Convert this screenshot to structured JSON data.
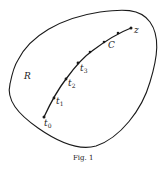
{
  "figure": {
    "caption": "Fig. 1",
    "region_label": "R",
    "curve_label": "C",
    "endpoint_label": "z",
    "points": [
      {
        "base": "t",
        "sub": "0"
      },
      {
        "base": "t",
        "sub": "1"
      },
      {
        "base": "t",
        "sub": "2"
      },
      {
        "base": "t",
        "sub": "3"
      }
    ],
    "colors": {
      "stroke": "#1a1a1a",
      "background": "#ffffff"
    }
  }
}
